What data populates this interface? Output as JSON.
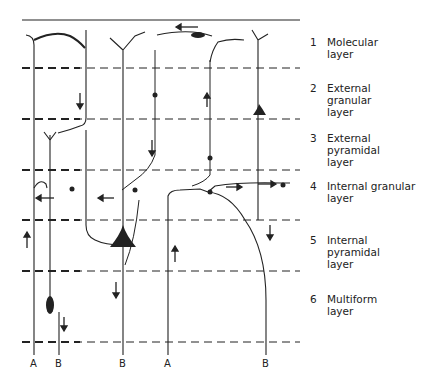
{
  "layers": [
    {
      "number": "1",
      "name": "Molecular\nlayer"
    },
    {
      "number": "2",
      "name": "External\ngranular\nlayer"
    },
    {
      "number": "3",
      "name": "External\npyramidal\nlayer"
    },
    {
      "number": "4",
      "name": "Internal granular\nlayer"
    },
    {
      "number": "5",
      "name": "Internal\npyramidal\nlayer"
    },
    {
      "number": "6",
      "name": "Multiform\nlayer"
    }
  ],
  "fiber_labels": [
    "A",
    "B",
    "B",
    "A",
    "B"
  ],
  "colors": {
    "ink": "#222222",
    "background": "#ffffff"
  }
}
